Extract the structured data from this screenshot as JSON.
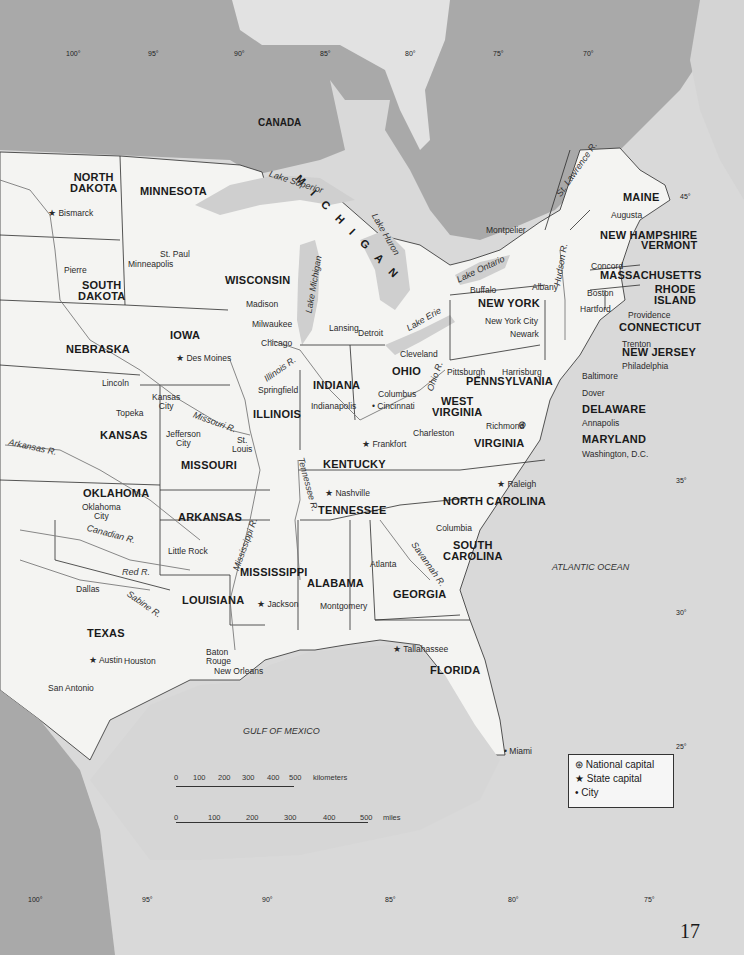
{
  "page": {
    "number": "17"
  },
  "colors": {
    "land": "#f4f4f2",
    "water": "#d6d6d6",
    "canada": "#a9a9a9",
    "border": "#2b2b2b"
  },
  "country_labels": {
    "canada": "CANADA"
  },
  "states": {
    "north_dakota": [
      "NORTH",
      "DAKOTA"
    ],
    "south_dakota": [
      "SOUTH",
      "DAKOTA"
    ],
    "minnesota": "MINNESOTA",
    "nebraska": "NEBRASKA",
    "iowa": "IOWA",
    "kansas": "KANSAS",
    "missouri": "MISSOURI",
    "oklahoma": "OKLAHOMA",
    "arkansas": "ARKANSAS",
    "texas": "TEXAS",
    "louisiana": "LOUISIANA",
    "wisconsin": "WISCONSIN",
    "michigan": "MICHIGAN",
    "illinois": "ILLINOIS",
    "indiana": "INDIANA",
    "ohio": "OHIO",
    "kentucky": "KENTUCKY",
    "tennessee": "TENNESSEE",
    "mississippi": "MISSISSIPPI",
    "alabama": "ALABAMA",
    "georgia": "GEORGIA",
    "florida": "FLORIDA",
    "south_carolina": [
      "SOUTH",
      "CAROLINA"
    ],
    "north_carolina": "NORTH CAROLINA",
    "virginia": "VIRGINIA",
    "west_virginia": [
      "WEST",
      "VIRGINIA"
    ],
    "pennsylvania": "PENNSYLVANIA",
    "new_york": "NEW YORK",
    "maryland": "MARYLAND",
    "delaware": "DELAWARE",
    "new_jersey": "NEW JERSEY",
    "connecticut": "CONNECTICUT",
    "rhode_island": [
      "RHODE",
      "ISLAND"
    ],
    "massachusetts": "MASSACHUSETTS",
    "vermont": "VERMONT",
    "new_hampshire": "NEW HAMPSHIRE",
    "maine": "MAINE"
  },
  "cities": {
    "bismarck": "Bismarck",
    "pierre": "Pierre",
    "st_paul": "St. Paul",
    "minneapolis": "Minneapolis",
    "madison": "Madison",
    "milwaukee": "Milwaukee",
    "chicago": "Chicago",
    "lansing": "Lansing",
    "detroit": "Detroit",
    "des_moines": "Des Moines",
    "lincoln": "Lincoln",
    "topeka": "Topeka",
    "kansas_city": [
      "Kansas",
      "City"
    ],
    "jefferson_city": [
      "Jefferson",
      "City"
    ],
    "st_louis": [
      "St.",
      "Louis"
    ],
    "springfield": "Springfield",
    "indianapolis": "Indianapolis",
    "cincinnati": "Cincinnati",
    "columbus": "Columbus",
    "cleveland": "Cleveland",
    "pittsburgh": "Pittsburgh",
    "harrisburg": "Harrisburg",
    "buffalo": "Buffalo",
    "albany": "Albany",
    "new_york_city": "New York City",
    "newark": "Newark",
    "trenton": "Trenton",
    "philadelphia": "Philadelphia",
    "baltimore": "Baltimore",
    "dover": "Dover",
    "annapolis": "Annapolis",
    "washington": "Washington, D.C.",
    "richmond": "Richmond",
    "charleston": "Charleston",
    "frankfort": "Frankfort",
    "nashville": "Nashville",
    "raleigh": "Raleigh",
    "columbia": "Columbia",
    "atlanta": "Atlanta",
    "montgomery": "Montgomery",
    "jackson": "Jackson",
    "tallahassee": "Tallahassee",
    "miami": "Miami",
    "little_rock": "Little Rock",
    "oklahoma_city": [
      "Oklahoma",
      "City"
    ],
    "dallas": "Dallas",
    "austin": "Austin",
    "houston": "Houston",
    "san_antonio": "San Antonio",
    "baton_rouge": [
      "Baton",
      "Rouge"
    ],
    "new_orleans": "New Orleans",
    "montpelier": "Montpelier",
    "augusta": "Augusta",
    "concord": "Concord",
    "boston": "Boston",
    "hartford": "Hartford",
    "providence": "Providence"
  },
  "water": {
    "lake_superior": "Lake Superior",
    "lake_michigan": "Lake Michigan",
    "lake_huron": "Lake Huron",
    "lake_erie": "Lake Erie",
    "lake_ontario": "Lake Ontario",
    "st_lawrence": "St. Lawrence R.",
    "hudson": "Hudson R.",
    "ohio_r": "Ohio R.",
    "illinois_r": "Illinois R.",
    "missouri_r": "Missouri R.",
    "mississippi_r": "Mississippi R.",
    "tennessee_r": "Tennessee R.",
    "arkansas_r": "Arkansas R.",
    "canadian_r": "Canadian R.",
    "red_r": "Red R.",
    "sabine_r": "Sabine R.",
    "savannah_r": "Savannah R.",
    "gulf": "GULF OF MEXICO",
    "atlantic": "ATLANTIC OCEAN"
  },
  "graticule": {
    "top_longitudes": [
      "100°",
      "95°",
      "90°",
      "85°",
      "80°",
      "75°",
      "70°"
    ],
    "bottom_longitudes": [
      "100°",
      "95°",
      "90°",
      "85°",
      "80°",
      "75°"
    ],
    "latitudes": [
      "45°",
      "35°",
      "30°",
      "25°"
    ]
  },
  "scale_bar": {
    "km_ticks": [
      "0",
      "100",
      "200",
      "300",
      "400",
      "500"
    ],
    "km_unit": "kilometers",
    "mi_ticks": [
      "0",
      "100",
      "200",
      "300",
      "400",
      "500"
    ],
    "mi_unit": "miles"
  },
  "legend": {
    "items": [
      {
        "symbol": "⊛",
        "label": "National capital"
      },
      {
        "symbol": "★",
        "label": "State capital"
      },
      {
        "symbol": "•",
        "label": "City"
      }
    ]
  }
}
